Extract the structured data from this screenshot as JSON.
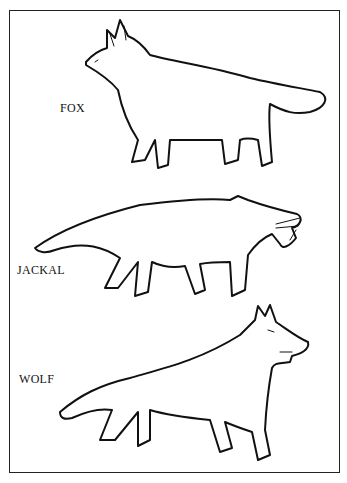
{
  "illustration": {
    "title": "Canid comparison",
    "labels": {
      "fox": "FOX",
      "jackal": "JACKAL",
      "wolf": "WOLF"
    },
    "colors": {
      "ink": "#111111",
      "background": "#ffffff"
    }
  }
}
